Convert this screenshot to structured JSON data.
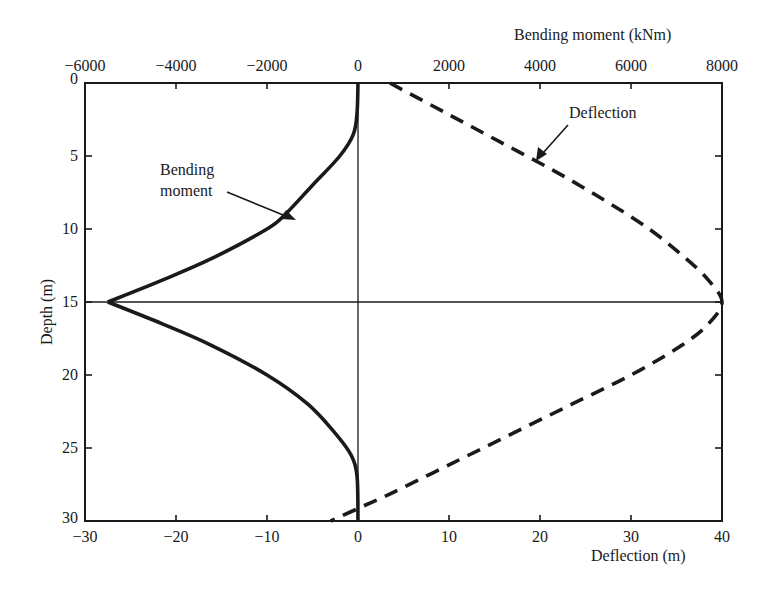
{
  "chart_data": {
    "type": "line",
    "title": "",
    "orientation": "depth-vertical (y axis inverted, depth increases downward)",
    "axes": {
      "top": {
        "label": "Bending moment (kNm)",
        "range": [
          -6000,
          8000
        ],
        "ticks": [
          -6000,
          -4000,
          -2000,
          0,
          2000,
          4000,
          6000,
          8000
        ],
        "tick_labels": [
          "−6000",
          "−4000",
          "−2000",
          "0",
          "2000",
          "4000",
          "6000",
          "8000"
        ]
      },
      "bottom": {
        "label": "Deflection (m)",
        "range": [
          -30,
          40
        ],
        "ticks": [
          -30,
          -20,
          -10,
          0,
          10,
          20,
          30,
          40
        ],
        "tick_labels": [
          "−30",
          "−20",
          "−10",
          "0",
          "10",
          "20",
          "30",
          "40"
        ]
      },
      "left": {
        "label": "Depth (m)",
        "range": [
          0,
          30
        ],
        "inverted": true,
        "ticks": [
          0,
          5,
          10,
          15,
          20,
          25,
          30
        ],
        "tick_labels": [
          "0",
          "5",
          "10",
          "15",
          "20",
          "25",
          "30"
        ]
      }
    },
    "reference_lines": [
      {
        "type": "vertical",
        "at_deflection": 0
      },
      {
        "type": "horizontal",
        "at_depth": 15
      }
    ],
    "grid": false,
    "legend": null,
    "series": [
      {
        "name": "Bending moment",
        "style": "solid",
        "axis": "top",
        "x_unit": "kNm",
        "points": [
          {
            "depth": 0,
            "value": 0
          },
          {
            "depth": 2,
            "value": -20
          },
          {
            "depth": 3.5,
            "value": -100
          },
          {
            "depth": 5,
            "value": -400
          },
          {
            "depth": 7,
            "value": -1000
          },
          {
            "depth": 9,
            "value": -1600
          },
          {
            "depth": 10,
            "value": -2000
          },
          {
            "depth": 12,
            "value": -3200
          },
          {
            "depth": 13.5,
            "value": -4300
          },
          {
            "depth": 15,
            "value": -5500
          },
          {
            "depth": 16.5,
            "value": -4300
          },
          {
            "depth": 18,
            "value": -3200
          },
          {
            "depth": 20,
            "value": -2000
          },
          {
            "depth": 22,
            "value": -1100
          },
          {
            "depth": 24,
            "value": -500
          },
          {
            "depth": 25.5,
            "value": -150
          },
          {
            "depth": 27,
            "value": -20
          },
          {
            "depth": 30,
            "value": 0
          }
        ]
      },
      {
        "name": "Deflection",
        "style": "dashed",
        "axis": "bottom",
        "x_unit": "m",
        "points": [
          {
            "depth": 0,
            "value": 3.5
          },
          {
            "depth": 2,
            "value": 9.5
          },
          {
            "depth": 4,
            "value": 15.5
          },
          {
            "depth": 6,
            "value": 21.5
          },
          {
            "depth": 8,
            "value": 27
          },
          {
            "depth": 10,
            "value": 32
          },
          {
            "depth": 12,
            "value": 36
          },
          {
            "depth": 13.5,
            "value": 38.5
          },
          {
            "depth": 15,
            "value": 40
          },
          {
            "depth": 16.5,
            "value": 38.5
          },
          {
            "depth": 18,
            "value": 35.5
          },
          {
            "depth": 20,
            "value": 30
          },
          {
            "depth": 22,
            "value": 23.5
          },
          {
            "depth": 24,
            "value": 17
          },
          {
            "depth": 26,
            "value": 10.5
          },
          {
            "depth": 28,
            "value": 4
          },
          {
            "depth": 29,
            "value": 0.5
          },
          {
            "depth": 30,
            "value": -3
          }
        ]
      }
    ],
    "annotations": [
      {
        "text_lines": [
          "Bending",
          "moment"
        ],
        "arrow_to": {
          "depth": 9.5,
          "series": "Bending moment"
        }
      },
      {
        "text": "Deflection",
        "arrow_to": {
          "depth": 5,
          "series": "Deflection"
        }
      }
    ]
  },
  "labels": {
    "top_axis_title": "Bending moment (kNm)",
    "bottom_axis_title": "Deflection (m)",
    "left_axis_title": "Depth (m)",
    "annotation_bending_line1": "Bending",
    "annotation_bending_line2": "moment",
    "annotation_deflection": "Deflection"
  },
  "colors": {
    "ink": "#1a1a1a",
    "background": "#ffffff"
  }
}
